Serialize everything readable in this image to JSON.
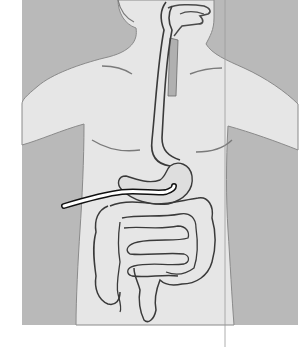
{
  "figure": {
    "type": "anatomical-illustration",
    "width": 308,
    "height": 347
  },
  "colors": {
    "page_background": "#ffffff",
    "panel_background": "#b9b9b9",
    "body_fill": "#e6e6e6",
    "organ_fill": "#dedede",
    "outline": "#4a4a4a",
    "organ_outline": "#3a3a3a",
    "trachea_fill": "#b0b0b0",
    "tube_fill": "#ffffff",
    "tube_outline": "#111111",
    "seam_line": "#9a9a9a"
  },
  "regions": {
    "panel": {
      "x": 22,
      "y": 0,
      "width": 276,
      "height": 325
    },
    "tube": {
      "start": [
        63,
        207
      ],
      "end": [
        174,
        187
      ]
    },
    "seam_x": 225
  }
}
